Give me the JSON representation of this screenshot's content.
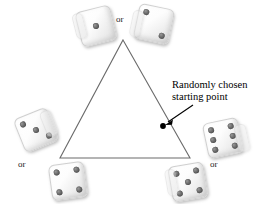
{
  "figure": {
    "background_color": "#ffffff",
    "line_color": "#6b6b6b",
    "dot_color": "#000000"
  },
  "annotation": {
    "line1": "Randomly chosen",
    "line2": "starting point",
    "arrow": "arrow-pointing-to-dot"
  },
  "or_labels": [
    {
      "id": "or-top",
      "text": "or"
    },
    {
      "id": "or-bottom-left",
      "text": "or"
    },
    {
      "id": "or-bottom-right",
      "text": "or"
    }
  ],
  "dice": [
    {
      "id": "die-top-left",
      "value": 1,
      "pips": [
        "p-mc"
      ]
    },
    {
      "id": "die-top-right",
      "value": 2,
      "pips": [
        "p-tl",
        "p-br"
      ]
    },
    {
      "id": "die-left",
      "value": 3,
      "pips": [
        "p-tl",
        "p-mc",
        "p-br"
      ]
    },
    {
      "id": "die-bottom-left",
      "value": 4,
      "pips": [
        "p-tl",
        "p-tr",
        "p-bl",
        "p-br"
      ]
    },
    {
      "id": "die-bottom-right",
      "value": 5,
      "pips": [
        "p-tl",
        "p-tr",
        "p-mc",
        "p-bl",
        "p-br"
      ]
    },
    {
      "id": "die-right",
      "value": 6,
      "pips": [
        "p-tl",
        "p-ml",
        "p-bl",
        "p-tr",
        "p-mr",
        "p-br"
      ]
    }
  ],
  "triangle": {
    "apex": {
      "x": 123,
      "y": 40
    },
    "bottom_left": {
      "x": 60,
      "y": 158
    },
    "bottom_right": {
      "x": 190,
      "y": 158
    }
  },
  "starting_point": {
    "x": 163,
    "y": 126
  }
}
